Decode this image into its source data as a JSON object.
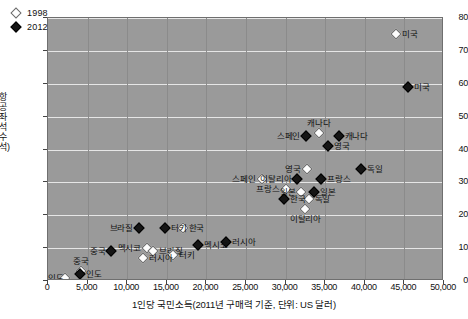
{
  "chart_data": {
    "type": "scatter",
    "title": "",
    "xlabel": "1인당 국민소득(2011년 구매력 기준, 단위: US 달러)",
    "ylabel": "항공좌석수(석)",
    "xlim": [
      0,
      50000
    ],
    "ylim": [
      0,
      80
    ],
    "xticks": [
      "0",
      "5,000",
      "10,000",
      "15,000",
      "20,000",
      "25,000",
      "30,000",
      "35,000",
      "40,000",
      "45,000",
      "50,000"
    ],
    "xtick_values": [
      0,
      5000,
      10000,
      15000,
      20000,
      25000,
      30000,
      35000,
      40000,
      45000,
      50000
    ],
    "yticks": [
      "0",
      "10",
      "20",
      "30",
      "40",
      "50",
      "60",
      "70",
      "80"
    ],
    "ytick_values": [
      0,
      10,
      20,
      30,
      40,
      50,
      60,
      70,
      80
    ],
    "grid": "horizontal-and-vertical",
    "legend_position": "top-left",
    "plot_background": "#9a9a9a",
    "gridline_color": "#e6e6e6",
    "series": [
      {
        "name": "1998",
        "marker": "white-diamond",
        "color": "#fdfdfd",
        "points": [
          {
            "label": "미국",
            "x": 44000,
            "y": 75,
            "label_side": "right"
          },
          {
            "label": "캐나다",
            "x": 34200,
            "y": 45,
            "label_side": "above"
          },
          {
            "label": "영국",
            "x": 32700,
            "y": 34,
            "label_side": "left"
          },
          {
            "label": "스페인",
            "x": 27000,
            "y": 31,
            "label_side": "left"
          },
          {
            "label": "프랑스",
            "x": 30000,
            "y": 28,
            "label_side": "left"
          },
          {
            "label": "일본",
            "x": 32000,
            "y": 27,
            "label_side": "left"
          },
          {
            "label": "독일",
            "x": 32900,
            "y": 25,
            "label_side": "right"
          },
          {
            "label": "이탈리아",
            "x": 32500,
            "y": 22,
            "label_side": "below"
          },
          {
            "label": "한국",
            "x": 17000,
            "y": 16,
            "label_side": "right"
          },
          {
            "label": "멕시코",
            "x": 12500,
            "y": 10,
            "label_side": "left"
          },
          {
            "label": "브라질",
            "x": 13300,
            "y": 9,
            "label_side": "right"
          },
          {
            "label": "터키",
            "x": 15800,
            "y": 8,
            "label_side": "right"
          },
          {
            "label": "러시아",
            "x": 12000,
            "y": 7,
            "label_side": "right"
          },
          {
            "label": "중국",
            "x": 4200,
            "y": 3,
            "label_side": "above"
          },
          {
            "label": "인도",
            "x": 2100,
            "y": 1,
            "label_side": "left"
          }
        ]
      },
      {
        "name": "2012",
        "marker": "black-diamond",
        "color": "#151515",
        "points": [
          {
            "label": "미국",
            "x": 45500,
            "y": 59,
            "label_side": "right"
          },
          {
            "label": "캐나다",
            "x": 36700,
            "y": 44,
            "label_side": "right"
          },
          {
            "label": "스페인",
            "x": 32600,
            "y": 44,
            "label_side": "left"
          },
          {
            "label": "영국",
            "x": 35400,
            "y": 41,
            "label_side": "right"
          },
          {
            "label": "독일",
            "x": 39500,
            "y": 34,
            "label_side": "right"
          },
          {
            "label": "프랑스",
            "x": 34500,
            "y": 31,
            "label_side": "right"
          },
          {
            "label": "이탈리아",
            "x": 31500,
            "y": 31,
            "label_side": "left"
          },
          {
            "label": "일본",
            "x": 33600,
            "y": 27,
            "label_side": "right"
          },
          {
            "label": "한국",
            "x": 29800,
            "y": 25,
            "label_side": "right"
          },
          {
            "label": "러시아",
            "x": 22500,
            "y": 12,
            "label_side": "right"
          },
          {
            "label": "멕시코",
            "x": 19000,
            "y": 11,
            "label_side": "right"
          },
          {
            "label": "터키",
            "x": 14800,
            "y": 16,
            "label_side": "right"
          },
          {
            "label": "브라질",
            "x": 11500,
            "y": 16,
            "label_side": "left"
          },
          {
            "label": "중국",
            "x": 8000,
            "y": 9,
            "label_side": "left"
          },
          {
            "label": "인도",
            "x": 4100,
            "y": 2,
            "label_side": "right"
          }
        ]
      }
    ]
  },
  "legend": {
    "items": [
      {
        "label": "1998",
        "marker": "white-diamond"
      },
      {
        "label": "2012",
        "marker": "black-diamond"
      }
    ]
  }
}
